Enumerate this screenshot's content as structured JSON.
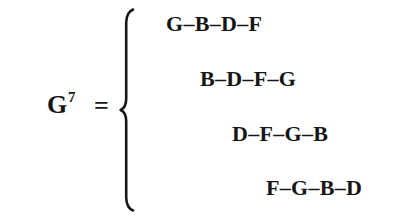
{
  "figure": {
    "background_color": "#ffffff",
    "ink_color": "#161616",
    "lhs": {
      "base_symbol": "G",
      "superscript": "7",
      "full_label": "G7"
    },
    "relation_symbol": "=",
    "brace": {
      "type": "left-curly-brace",
      "spans_rows": 4
    },
    "rows": [
      {
        "text": "G–B–D–F",
        "notes": [
          "G",
          "B",
          "D",
          "F"
        ]
      },
      {
        "text": "B–D–F–G",
        "notes": [
          "B",
          "D",
          "F",
          "G"
        ]
      },
      {
        "text": "D–F–G–B",
        "notes": [
          "D",
          "F",
          "G",
          "B"
        ]
      },
      {
        "text": "F–G–B–D",
        "notes": [
          "F",
          "G",
          "B",
          "D"
        ]
      }
    ]
  }
}
